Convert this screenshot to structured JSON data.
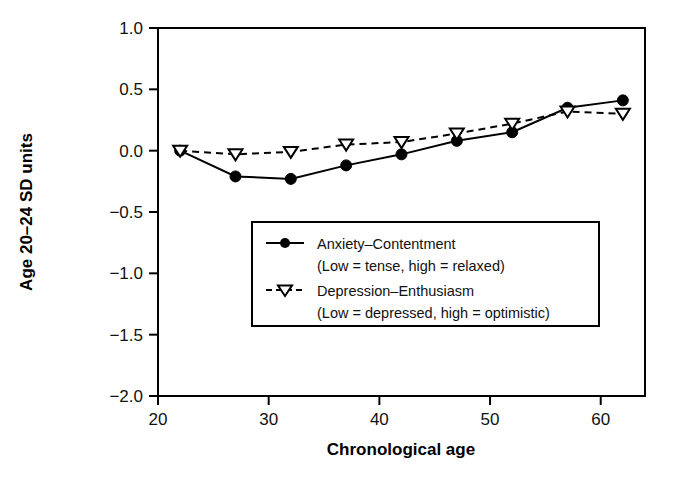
{
  "chart_data": {
    "type": "line",
    "title": "",
    "xlabel": "Chronological age",
    "ylabel": "Age 20–24 SD units",
    "xlim": [
      20,
      64
    ],
    "ylim": [
      -2.0,
      1.0
    ],
    "grid": false,
    "legend_position": "center",
    "x": [
      22,
      27,
      32,
      37,
      42,
      47,
      52,
      57,
      62
    ],
    "xticks": [
      "20",
      "30",
      "40",
      "50",
      "60"
    ],
    "xtick_values": [
      20,
      30,
      40,
      50,
      60
    ],
    "yticks": [
      "1.0",
      "0.5",
      "0.0",
      "−0.5",
      "−1.0",
      "−1.5",
      "−2.0"
    ],
    "ytick_values": [
      1.0,
      0.5,
      0.0,
      -0.5,
      -1.0,
      -1.5,
      -2.0
    ],
    "series": [
      {
        "name": "Anxiety–Contentment",
        "note": "(Low = tense, high = relaxed)",
        "marker": "filled-circle",
        "linestyle": "solid",
        "color": "#000000",
        "values": [
          0.0,
          -0.21,
          -0.23,
          -0.12,
          -0.03,
          0.08,
          0.15,
          0.35,
          0.41
        ]
      },
      {
        "name": "Depression–Enthusiasm",
        "note": "(Low = depressed, high = optimistic)",
        "marker": "open-down-triangle",
        "linestyle": "dashed",
        "color": "#000000",
        "values": [
          0.0,
          -0.03,
          -0.01,
          0.05,
          0.07,
          0.14,
          0.22,
          0.32,
          0.3
        ]
      }
    ]
  },
  "legend": {
    "entries": [
      {
        "label": "Anxiety–Contentment",
        "sub": "(Low = tense, high = relaxed)"
      },
      {
        "label": "Depression–Enthusiasm",
        "sub": "(Low = depressed, high = optimistic)"
      }
    ]
  },
  "axes": {
    "y_title": "Age 20–24 SD units",
    "x_title": "Chronological age",
    "ytick_labels": [
      "1.0",
      "0.5",
      "0.0",
      "−0.5",
      "−1.0",
      "−1.5",
      "−2.0"
    ],
    "xtick_labels": [
      "20",
      "30",
      "40",
      "50",
      "60"
    ]
  },
  "colors": {
    "ink": "#000000",
    "background": "#ffffff"
  }
}
